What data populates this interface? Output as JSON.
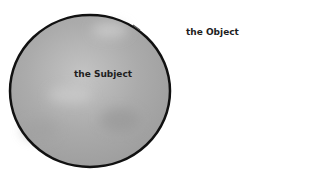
{
  "diagram": {
    "subject": {
      "label": "the Subject",
      "fill": "#a9a9a9",
      "stroke": "#111111"
    },
    "object": {
      "label": "the Object"
    }
  }
}
